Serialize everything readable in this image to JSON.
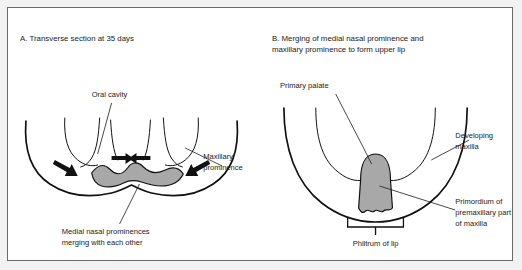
{
  "figure": {
    "background_color": "#f2f2f2",
    "page_color": "#ffffff",
    "border_color": "#6b6b6b",
    "shade_color": "#a8a8a8",
    "ink_color": "#111111"
  },
  "panel_a": {
    "title": "A. Transverse section at 35 days",
    "labels": {
      "oral_cavity": "Oral cavity",
      "maxillary_prominence_line1": "Maxillary",
      "maxillary_prominence_line2": "prominence",
      "medial_nasal_line1": "Medial nasal prominences",
      "medial_nasal_line2": "merging with each other"
    }
  },
  "panel_b": {
    "title_line1": "B. Merging of medial nasal prominence and",
    "title_line2": "maxillary prominence to form upper lip",
    "labels": {
      "primary_palate": "Primary palate",
      "developing_maxilla_line1": "Developing",
      "developing_maxilla_line2": "maxilla",
      "primordium_line1": "Primordium of",
      "primordium_line2": "premaxillary part",
      "primordium_line3": "of maxilla",
      "philtrum": "Philtrum of lip"
    }
  }
}
